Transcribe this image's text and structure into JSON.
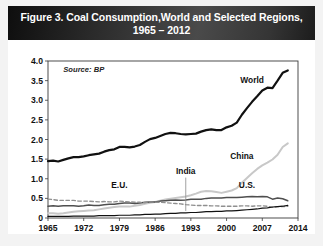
{
  "figure": {
    "title_line1": "Figure 3. Coal Consumption,World and Selected Regions,",
    "title_line2": "1965 – 2012",
    "source": "Source: BP",
    "ylabel": "Billion Tons of Oil Equivalent"
  },
  "colors": {
    "title_bar_dark": "#0e0e0e",
    "title_bar_light": "#4a4a4a",
    "title_text": "#ffffff",
    "world_line": "#111111",
    "china_line": "#c8c8c8",
    "us_line": "#4f4f4f",
    "eu_line": "#8f8f8f",
    "india_line": "#111111",
    "page_background": "#f3f3f3",
    "plot_background": "#ffffff"
  },
  "chart_data": {
    "type": "line",
    "title": "Figure 3. Coal Consumption,World and Selected Regions, 1965 – 2012",
    "subtitle": "1965 – 2012",
    "source": "Source: BP",
    "xlabel": "",
    "ylabel": "Billion Tons of Oil Equivalent",
    "xlim": [
      1965,
      2014
    ],
    "ylim": [
      0,
      4.0
    ],
    "xticks": [
      1965,
      1972,
      1979,
      1986,
      1993,
      2000,
      2007,
      2014
    ],
    "yticks": [
      "0",
      "0.5",
      "1.0",
      "1.5",
      "2.0",
      "2.5",
      "3.0",
      "3.5",
      "4.0"
    ],
    "ytick_values": [
      0,
      0.5,
      1.0,
      1.5,
      2.0,
      2.5,
      3.0,
      3.5,
      4.0
    ],
    "grid": false,
    "legend": "inline-labels",
    "x": [
      1965,
      1966,
      1967,
      1968,
      1969,
      1970,
      1971,
      1972,
      1973,
      1974,
      1975,
      1976,
      1977,
      1978,
      1979,
      1980,
      1981,
      1982,
      1983,
      1984,
      1985,
      1986,
      1987,
      1988,
      1989,
      1990,
      1991,
      1992,
      1993,
      1994,
      1995,
      1996,
      1997,
      1998,
      1999,
      2000,
      2001,
      2002,
      2003,
      2004,
      2005,
      2006,
      2007,
      2008,
      2009,
      2010,
      2011,
      2012
    ],
    "series": [
      {
        "name": "World",
        "label": "World",
        "color": "#111111",
        "style": "solid",
        "width": 2.2,
        "values": [
          1.45,
          1.46,
          1.44,
          1.48,
          1.52,
          1.55,
          1.55,
          1.57,
          1.6,
          1.62,
          1.64,
          1.69,
          1.73,
          1.75,
          1.81,
          1.81,
          1.8,
          1.82,
          1.86,
          1.94,
          2.01,
          2.04,
          2.09,
          2.14,
          2.17,
          2.16,
          2.14,
          2.13,
          2.14,
          2.15,
          2.2,
          2.24,
          2.26,
          2.24,
          2.24,
          2.31,
          2.35,
          2.43,
          2.63,
          2.8,
          2.96,
          3.1,
          3.25,
          3.32,
          3.31,
          3.5,
          3.7,
          3.76
        ]
      },
      {
        "name": "China",
        "label": "China",
        "color": "#c8c8c8",
        "style": "solid",
        "width": 2.0,
        "values": [
          0.12,
          0.12,
          0.11,
          0.12,
          0.14,
          0.16,
          0.17,
          0.18,
          0.19,
          0.2,
          0.22,
          0.24,
          0.26,
          0.28,
          0.29,
          0.29,
          0.29,
          0.31,
          0.33,
          0.36,
          0.39,
          0.41,
          0.44,
          0.47,
          0.49,
          0.51,
          0.53,
          0.55,
          0.58,
          0.62,
          0.67,
          0.69,
          0.68,
          0.66,
          0.64,
          0.67,
          0.7,
          0.76,
          0.9,
          1.02,
          1.14,
          1.25,
          1.34,
          1.41,
          1.49,
          1.61,
          1.81,
          1.9
        ]
      },
      {
        "name": "U.S.",
        "label": "U.S.",
        "color": "#4f4f4f",
        "style": "solid",
        "width": 1.5,
        "values": [
          0.3,
          0.31,
          0.3,
          0.31,
          0.31,
          0.31,
          0.3,
          0.31,
          0.33,
          0.32,
          0.32,
          0.34,
          0.35,
          0.35,
          0.37,
          0.38,
          0.38,
          0.37,
          0.38,
          0.4,
          0.41,
          0.41,
          0.43,
          0.44,
          0.45,
          0.46,
          0.45,
          0.46,
          0.48,
          0.48,
          0.48,
          0.5,
          0.51,
          0.51,
          0.51,
          0.52,
          0.52,
          0.52,
          0.53,
          0.54,
          0.55,
          0.54,
          0.55,
          0.54,
          0.48,
          0.51,
          0.49,
          0.44
        ]
      },
      {
        "name": "E.U.",
        "label": "E.U.",
        "color": "#8f8f8f",
        "style": "dashed",
        "width": 1.4,
        "values": [
          0.48,
          0.47,
          0.45,
          0.45,
          0.45,
          0.45,
          0.43,
          0.43,
          0.43,
          0.42,
          0.41,
          0.42,
          0.41,
          0.41,
          0.43,
          0.42,
          0.41,
          0.4,
          0.4,
          0.39,
          0.41,
          0.4,
          0.4,
          0.39,
          0.38,
          0.37,
          0.36,
          0.34,
          0.33,
          0.32,
          0.32,
          0.32,
          0.31,
          0.31,
          0.3,
          0.3,
          0.3,
          0.3,
          0.31,
          0.31,
          0.3,
          0.31,
          0.31,
          0.3,
          0.27,
          0.29,
          0.29,
          0.3
        ]
      },
      {
        "name": "India",
        "label": "India",
        "color": "#111111",
        "style": "solid",
        "width": 1.2,
        "values": [
          0.04,
          0.04,
          0.04,
          0.04,
          0.04,
          0.05,
          0.05,
          0.05,
          0.05,
          0.05,
          0.06,
          0.06,
          0.06,
          0.06,
          0.07,
          0.07,
          0.07,
          0.08,
          0.08,
          0.09,
          0.09,
          0.1,
          0.1,
          0.11,
          0.12,
          0.12,
          0.13,
          0.13,
          0.14,
          0.14,
          0.15,
          0.16,
          0.16,
          0.17,
          0.17,
          0.18,
          0.18,
          0.19,
          0.2,
          0.21,
          0.22,
          0.23,
          0.25,
          0.26,
          0.28,
          0.29,
          0.3,
          0.32
        ]
      }
    ],
    "annotations": [
      {
        "text": "World",
        "x": 2005,
        "y": 3.45
      },
      {
        "text": "China",
        "x": 2003,
        "y": 1.5
      },
      {
        "text": "U.S.",
        "x": 2004,
        "y": 0.76
      },
      {
        "text": "E.U.",
        "x": 1979,
        "y": 0.77
      },
      {
        "text": "India",
        "x": 1992,
        "y": 1.13
      },
      {
        "text": "Source: BP",
        "x": 1968,
        "y": 3.72
      }
    ]
  }
}
